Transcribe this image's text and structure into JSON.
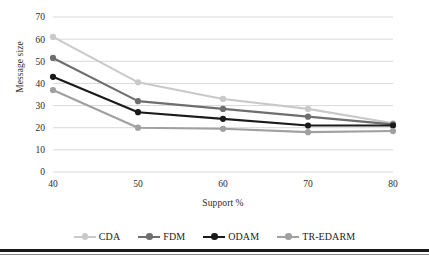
{
  "chart_data": {
    "type": "line",
    "title": "",
    "xlabel": "Support %",
    "ylabel": "Message size",
    "categories": [
      40,
      50,
      60,
      70,
      80
    ],
    "x_tick_labels": [
      "40",
      "50",
      "60",
      "70",
      "80"
    ],
    "y_tick_labels": [
      "0",
      "10",
      "20",
      "30",
      "40",
      "50",
      "60",
      "70"
    ],
    "y_ticks": [
      0,
      10,
      20,
      30,
      40,
      50,
      60,
      70
    ],
    "ylim": [
      0,
      70
    ],
    "xlim": [
      40,
      80
    ],
    "grid": "horizontal",
    "legend_position": "bottom",
    "series": [
      {
        "name": "CDA",
        "color": "#c9c9c9",
        "values": [
          61,
          40.5,
          33,
          28.5,
          22
        ]
      },
      {
        "name": "FDM",
        "color": "#6e6e6e",
        "values": [
          51.5,
          32,
          28.5,
          25,
          21.5
        ]
      },
      {
        "name": "ODAM",
        "color": "#1a1a1a",
        "values": [
          43,
          27,
          24,
          21,
          21
        ]
      },
      {
        "name": "TR-EDARM",
        "color": "#a0a0a0",
        "values": [
          37,
          20,
          19.5,
          18,
          18.5
        ]
      }
    ]
  },
  "legend": {
    "items": [
      {
        "label": "CDA",
        "color": "#c9c9c9"
      },
      {
        "label": "FDM",
        "color": "#6e6e6e"
      },
      {
        "label": "ODAM",
        "color": "#1a1a1a"
      },
      {
        "label": "TR-EDARM",
        "color": "#a0a0a0"
      }
    ]
  },
  "axes": {
    "x_title": "Support %",
    "y_title": "Message size"
  }
}
